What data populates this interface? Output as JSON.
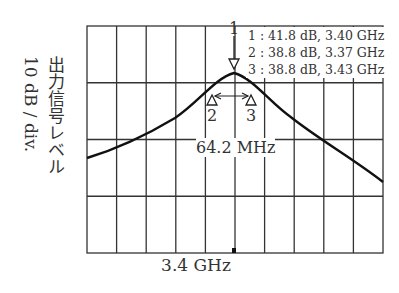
{
  "chart_data": {
    "type": "line",
    "title": "",
    "xlabel": "3.4 GHz",
    "ylabel": "出力信号レベル 10 dB / div.",
    "x_center": "3.4 GHz",
    "y_scale": "10 dB / div.",
    "grid": {
      "on": true,
      "x_divisions": 10,
      "y_divisions": 4
    },
    "series": [
      {
        "name": "output",
        "x_ghz": [
          3.07,
          3.14,
          3.2,
          3.26,
          3.3,
          3.34,
          3.37,
          3.4,
          3.43,
          3.46,
          3.5,
          3.56,
          3.62,
          3.68,
          3.73
        ],
        "y_db": [
          13.5,
          16.5,
          20.0,
          25.0,
          30.0,
          35.5,
          38.8,
          41.8,
          38.8,
          35.5,
          30.0,
          24.0,
          19.0,
          15.0,
          12.3
        ]
      }
    ],
    "markers": [
      {
        "id": "1",
        "level": "41.8 dB",
        "freq": "3.40 GHz"
      },
      {
        "id": "2",
        "level": "38.8 dB",
        "freq": "3.37 GHz"
      },
      {
        "id": "3",
        "level": "38.8 dB",
        "freq": "3.43 GHz"
      }
    ],
    "annotations": [
      "64.2 MHz"
    ]
  },
  "labels": {
    "ylabel_line1": "出力信号レベル",
    "ylabel_line2": "10 dB / div.",
    "xlabel": "3.4 GHz",
    "bandwidth": "64.2 MHz",
    "marker1_legend": "1 : 41.8 dB, 3.40 GHz",
    "marker2_legend": "2 : 38.8 dB, 3.37 GHz",
    "marker3_legend": "3 : 38.8 dB, 3.43 GHz",
    "marker1_id": "1",
    "marker2_id": "2",
    "marker3_id": "3"
  }
}
